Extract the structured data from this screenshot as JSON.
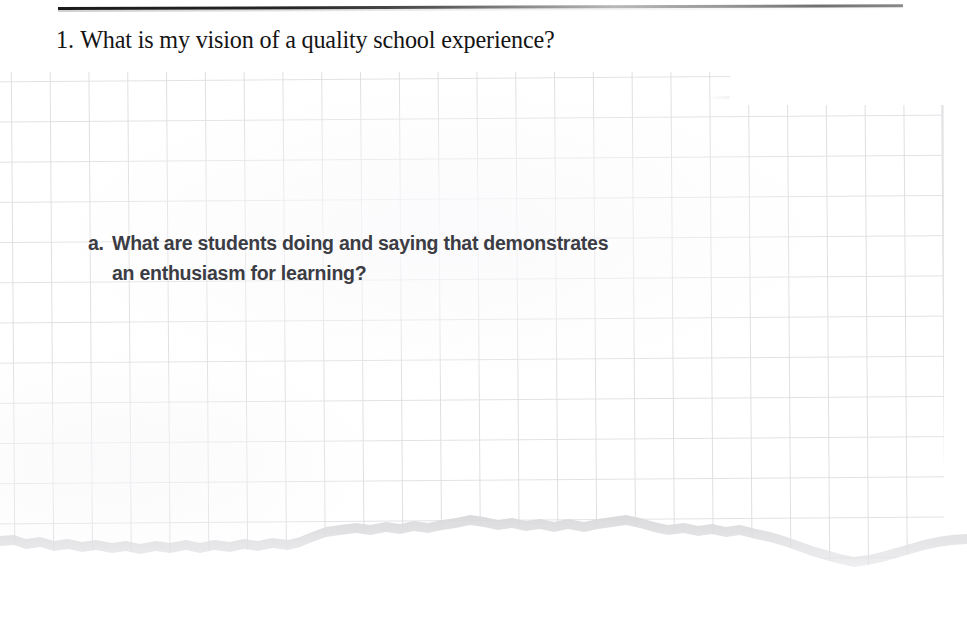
{
  "document": {
    "type": "worksheet-page",
    "background_color": "#ffffff",
    "rule_color": "#1a1a1a"
  },
  "header": {
    "rule_name": "top-horizontal-rule"
  },
  "question": {
    "number": "1.",
    "text": "What is my vision of a quality school experience?",
    "color": "#141414"
  },
  "sub_question": {
    "marker": "a.",
    "text": "What are students doing and saying that demonstrates an enthusiasm for learning?",
    "line1": "What are students doing and saying that demonstrates",
    "line2": "an enthusiasm for learning?",
    "color": "#3c3c44"
  },
  "paper": {
    "name": "torn-graph-paper-sheet",
    "grid_line_color": "#dfdfe2",
    "grid_cell_width_px": 38.8,
    "grid_cell_height_px": 40.2,
    "sheet_color": "#ffffff",
    "edge_shadow_color": "#dcdcdf",
    "bottom_edge": "torn"
  }
}
